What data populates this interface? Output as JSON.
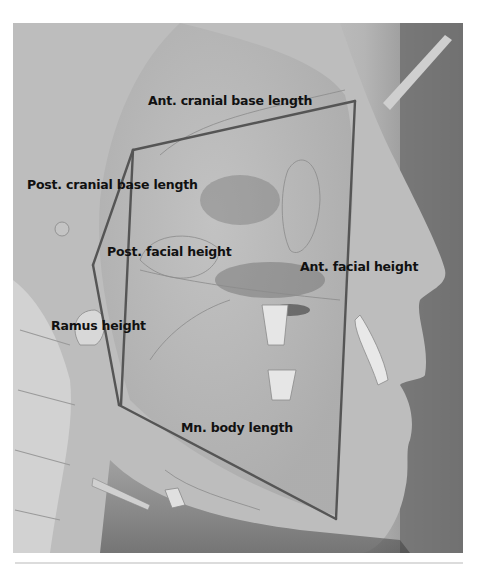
{
  "figure": {
    "labels": {
      "ant_cranial_base_length": "Ant. cranial base length",
      "post_cranial_base_length": "Post. cranial base length",
      "post_facial_height": "Post. facial height",
      "ant_facial_height": "Ant. facial height",
      "ramus_height": "Ramus height",
      "mn_body_length": "Mn. body length"
    },
    "landmarks": {
      "sella": [
        133,
        150
      ],
      "nasion": [
        355,
        101
      ],
      "articulare": [
        93,
        265
      ],
      "gonion": [
        119,
        405
      ],
      "menton": [
        336,
        519
      ]
    },
    "colors": {
      "measurement_line": "#555555",
      "label_text": "#111111"
    }
  }
}
